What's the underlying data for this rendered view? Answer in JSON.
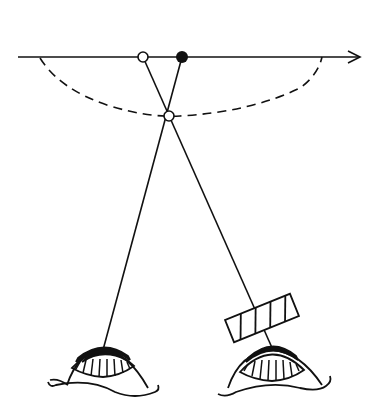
{
  "diagram": {
    "title": "",
    "colors": {
      "stroke": "#111111",
      "background": "#ffffff"
    },
    "axis": {
      "x1": 18,
      "y": 57,
      "x2": 360,
      "arrow": true
    },
    "points": [
      {
        "name": "perceived-point-open",
        "cx": 143,
        "cy": 57,
        "filled": false
      },
      {
        "name": "actual-point-filled",
        "cx": 182,
        "cy": 57,
        "filled": true
      },
      {
        "name": "fixation-point-open",
        "cx": 169,
        "cy": 116,
        "filled": false
      }
    ],
    "eyes": [
      {
        "name": "left-eye",
        "cx": 103,
        "cy": 360
      },
      {
        "name": "right-eye",
        "cx": 272,
        "cy": 360
      }
    ],
    "filter": {
      "name": "hatched-prism",
      "cx": 262,
      "cy": 318,
      "angle": -22
    }
  }
}
